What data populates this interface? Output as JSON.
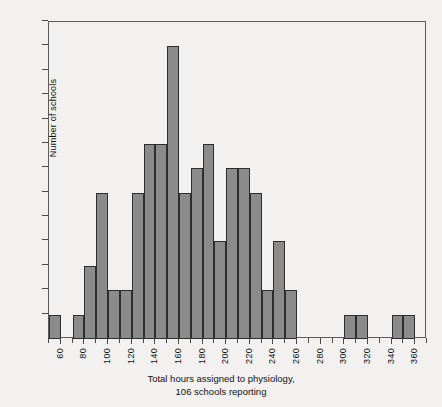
{
  "figure": {
    "caption_line1": "Total hours assigned to physiology,",
    "caption_line2": "106 schools reporting",
    "background_color": "#f2f1ef",
    "bar_fill_color": "#8b8b8b",
    "bar_edge_color": "#2d2d2d",
    "axis_color": "#4a4a4a"
  },
  "chart_data": {
    "type": "bar",
    "title": "",
    "subtitle": "",
    "xlabel": "Total hours assigned to physiology, 106 schools reporting",
    "ylabel": "Number of schools",
    "grid": false,
    "legend": false,
    "xlim": [
      50,
      370
    ],
    "ylim": [
      0,
      13
    ],
    "bin_width": 10,
    "total_count": 106,
    "x_tick_labels": [
      "60",
      "80",
      "100",
      "120",
      "140",
      "160",
      "180",
      "200",
      "220",
      "240",
      "260",
      "280",
      "300",
      "320",
      "340",
      "360"
    ],
    "x_minor_ticks": [
      50,
      70,
      90,
      110,
      130,
      150,
      170,
      190,
      210,
      230,
      250,
      270,
      290,
      310,
      330,
      350,
      370
    ],
    "y_tick_labels": [
      "1",
      "2",
      "3",
      "4",
      "5",
      "6",
      "7",
      "8",
      "9",
      "10",
      "11",
      "12",
      "13"
    ],
    "categories": [
      "50-60",
      "60-70",
      "70-80",
      "80-90",
      "90-100",
      "100-110",
      "110-120",
      "120-130",
      "130-140",
      "140-150",
      "150-160",
      "160-170",
      "170-180",
      "180-190",
      "190-200",
      "200-210",
      "210-220",
      "220-230",
      "230-240",
      "240-250",
      "250-260",
      "260-270",
      "270-280",
      "280-290",
      "290-300",
      "300-310",
      "310-320",
      "320-330",
      "330-340",
      "340-350",
      "350-360"
    ],
    "bins": [
      {
        "start": 50,
        "end": 60,
        "count": 1
      },
      {
        "start": 60,
        "end": 70,
        "count": 0
      },
      {
        "start": 70,
        "end": 80,
        "count": 1
      },
      {
        "start": 80,
        "end": 90,
        "count": 3
      },
      {
        "start": 90,
        "end": 100,
        "count": 6
      },
      {
        "start": 100,
        "end": 110,
        "count": 2
      },
      {
        "start": 110,
        "end": 120,
        "count": 2
      },
      {
        "start": 120,
        "end": 130,
        "count": 6
      },
      {
        "start": 130,
        "end": 140,
        "count": 8
      },
      {
        "start": 140,
        "end": 150,
        "count": 8
      },
      {
        "start": 150,
        "end": 160,
        "count": 12
      },
      {
        "start": 160,
        "end": 170,
        "count": 6
      },
      {
        "start": 170,
        "end": 180,
        "count": 7
      },
      {
        "start": 180,
        "end": 190,
        "count": 8
      },
      {
        "start": 190,
        "end": 200,
        "count": 4
      },
      {
        "start": 200,
        "end": 210,
        "count": 7
      },
      {
        "start": 210,
        "end": 220,
        "count": 7
      },
      {
        "start": 220,
        "end": 230,
        "count": 6
      },
      {
        "start": 230,
        "end": 240,
        "count": 2
      },
      {
        "start": 240,
        "end": 250,
        "count": 4
      },
      {
        "start": 250,
        "end": 260,
        "count": 2
      },
      {
        "start": 260,
        "end": 270,
        "count": 0
      },
      {
        "start": 270,
        "end": 280,
        "count": 0
      },
      {
        "start": 280,
        "end": 290,
        "count": 0
      },
      {
        "start": 290,
        "end": 300,
        "count": 0
      },
      {
        "start": 300,
        "end": 310,
        "count": 1
      },
      {
        "start": 310,
        "end": 320,
        "count": 1
      },
      {
        "start": 320,
        "end": 330,
        "count": 0
      },
      {
        "start": 330,
        "end": 340,
        "count": 0
      },
      {
        "start": 340,
        "end": 350,
        "count": 1
      },
      {
        "start": 350,
        "end": 360,
        "count": 1
      }
    ],
    "values": [
      1,
      0,
      1,
      3,
      6,
      2,
      2,
      6,
      8,
      8,
      12,
      6,
      7,
      8,
      4,
      7,
      7,
      6,
      2,
      4,
      2,
      0,
      0,
      0,
      0,
      1,
      1,
      0,
      0,
      1,
      1
    ]
  }
}
